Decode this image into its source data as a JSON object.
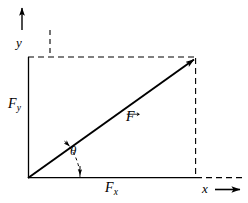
{
  "figure": {
    "colors": {
      "stroke": "#000000",
      "background": "#ffffff"
    }
  },
  "axes": {
    "x_label": "x",
    "y_label": "y",
    "origin": {
      "x": 28,
      "y": 178
    }
  },
  "labels": {
    "vector": "F",
    "component_x": "F",
    "component_x_sub": "x",
    "component_y": "F",
    "component_y_sub": "y",
    "angle": "θ"
  },
  "geometry": {
    "origin_x": 28,
    "origin_y": 178,
    "tip_x": 196,
    "tip_y": 58,
    "rect_left": 28,
    "rect_top": 57,
    "rect_right": 196,
    "rect_bottom": 178,
    "x_axis_arrow_start": 215,
    "x_axis_arrow_end": 240,
    "y_axis_arrow_top": 8,
    "y_axis_arrow_bottom": 30,
    "y_axis_x": 22,
    "dash_pattern": "6 4",
    "angle_arc_radius": 52
  }
}
